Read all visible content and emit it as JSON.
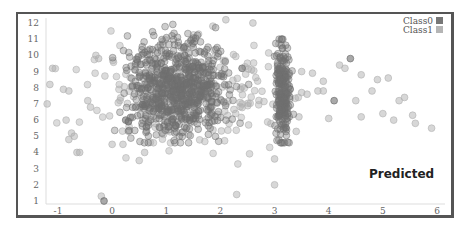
{
  "chart_data": {
    "type": "scatter",
    "title": "",
    "annotation": "Predicted",
    "xlabel": "",
    "ylabel": "",
    "xlim": [
      -1.2,
      6.2
    ],
    "ylim": [
      0.8,
      12.4
    ],
    "x_ticks": [
      "-1",
      "0",
      "1",
      "2",
      "3",
      "4",
      "5",
      "6"
    ],
    "y_ticks": [
      "1",
      "2",
      "3",
      "4",
      "5",
      "6",
      "7",
      "8",
      "9",
      "10",
      "11",
      "12"
    ],
    "grid": false,
    "legend_position": "top-right",
    "legend": [
      {
        "name": "Class0",
        "color": "#777777"
      },
      {
        "name": "Class1",
        "color": "#b5b5b5"
      }
    ],
    "series": [
      {
        "name": "Class0",
        "color": "#6f6f6f",
        "description": "dense cluster centered near (1.2, 8), spanning x 0–2.2, y 4.5–12; narrow vertical band at x≈3.1 spanning y 4.5–11",
        "clusters": [
          {
            "cx": 1.2,
            "cy": 8.0,
            "sx": 0.45,
            "sy": 1.5,
            "n": 700
          },
          {
            "cx": 3.15,
            "cy": 7.5,
            "sx": 0.07,
            "sy": 1.6,
            "n": 220
          }
        ],
        "points": [
          [
            -0.15,
            1.0
          ],
          [
            0.3,
            5.9
          ],
          [
            0.25,
            6.0
          ],
          [
            2.4,
            9.2
          ],
          [
            4.4,
            9.8
          ],
          [
            4.1,
            7.2
          ]
        ]
      },
      {
        "name": "Class1",
        "color": "#b0b0b0",
        "description": "sparse scatter around the main cluster and right side",
        "points": [
          [
            -1.2,
            7.0
          ],
          [
            -1.15,
            8.2
          ],
          [
            -1.1,
            9.2
          ],
          [
            -0.9,
            7.9
          ],
          [
            -0.8,
            7.8
          ],
          [
            -0.85,
            6.0
          ],
          [
            -0.75,
            5.2
          ],
          [
            -0.7,
            5.0
          ],
          [
            -0.65,
            4.0
          ],
          [
            -0.6,
            4.0
          ],
          [
            -0.8,
            4.8
          ],
          [
            -0.2,
            1.3
          ],
          [
            -0.3,
            10.0
          ],
          [
            -0.25,
            9.8
          ],
          [
            -0.45,
            7.2
          ],
          [
            -0.4,
            6.8
          ],
          [
            0.0,
            4.5
          ],
          [
            0.2,
            4.5
          ],
          [
            0.5,
            3.5
          ],
          [
            0.6,
            4.0
          ],
          [
            2.3,
            1.4
          ],
          [
            2.6,
            12.0
          ],
          [
            2.1,
            12.2
          ],
          [
            3.0,
            2.0
          ],
          [
            3.0,
            3.6
          ],
          [
            3.5,
            9.0
          ],
          [
            3.7,
            8.9
          ],
          [
            3.8,
            7.8
          ],
          [
            3.9,
            7.8
          ],
          [
            3.6,
            7.6
          ],
          [
            3.5,
            7.7
          ],
          [
            3.9,
            8.4
          ],
          [
            4.2,
            9.4
          ],
          [
            4.3,
            9.2
          ],
          [
            4.6,
            8.8
          ],
          [
            4.9,
            8.5
          ],
          [
            5.1,
            8.6
          ],
          [
            4.5,
            7.2
          ],
          [
            4.8,
            7.8
          ],
          [
            5.0,
            6.4
          ],
          [
            5.3,
            7.2
          ],
          [
            5.4,
            7.4
          ],
          [
            4.6,
            6.2
          ],
          [
            4.0,
            6.1
          ],
          [
            5.2,
            6.0
          ],
          [
            5.6,
            5.8
          ],
          [
            5.9,
            5.5
          ],
          [
            5.55,
            6.3
          ],
          [
            3.45,
            6.2
          ],
          [
            3.4,
            5.3
          ]
        ]
      }
    ]
  }
}
